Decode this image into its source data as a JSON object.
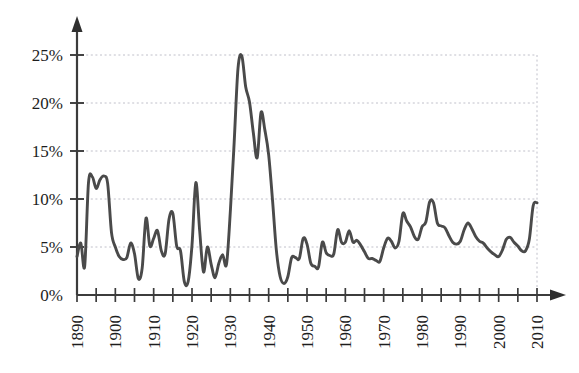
{
  "chart_data": {
    "type": "line",
    "title": "",
    "subtitle": "",
    "xlabel": "",
    "ylabel": "",
    "xlim": [
      1890,
      2010
    ],
    "ylim": [
      0,
      27
    ],
    "grid": true,
    "legend": null,
    "y_ticks": [
      0,
      5,
      10,
      15,
      20,
      25
    ],
    "y_tick_labels": [
      "0%",
      "5%",
      "10%",
      "15%",
      "20%",
      "25%"
    ],
    "x_ticks": [
      1890,
      1900,
      1910,
      1920,
      1930,
      1940,
      1950,
      1960,
      1970,
      1980,
      1990,
      2000,
      2010
    ],
    "x_tick_labels": [
      "1890",
      "1900",
      "1910",
      "1920",
      "1930",
      "1940",
      "1950",
      "1960",
      "1970",
      "1980",
      "1990",
      "2000",
      "2010"
    ],
    "x_minor_tick_interval": 5,
    "x_tick_label_rotation": -90,
    "series": [
      {
        "name": "Unemployment rate",
        "color": "#4a4a4a",
        "x": [
          1890,
          1891,
          1892,
          1893,
          1894,
          1895,
          1896,
          1897,
          1898,
          1899,
          1900,
          1901,
          1902,
          1903,
          1904,
          1905,
          1906,
          1907,
          1908,
          1909,
          1910,
          1911,
          1912,
          1913,
          1914,
          1915,
          1916,
          1917,
          1918,
          1919,
          1920,
          1921,
          1922,
          1923,
          1924,
          1925,
          1926,
          1927,
          1928,
          1929,
          1930,
          1931,
          1932,
          1933,
          1934,
          1935,
          1936,
          1937,
          1938,
          1939,
          1940,
          1941,
          1942,
          1943,
          1944,
          1945,
          1946,
          1947,
          1948,
          1949,
          1950,
          1951,
          1952,
          1953,
          1954,
          1955,
          1956,
          1957,
          1958,
          1959,
          1960,
          1961,
          1962,
          1963,
          1964,
          1965,
          1966,
          1967,
          1968,
          1969,
          1970,
          1971,
          1972,
          1973,
          1974,
          1975,
          1976,
          1977,
          1978,
          1979,
          1980,
          1981,
          1982,
          1983,
          1984,
          1985,
          1986,
          1987,
          1988,
          1989,
          1990,
          1991,
          1992,
          1993,
          1994,
          1995,
          1996,
          1997,
          1998,
          1999,
          2000,
          2001,
          2002,
          2003,
          2004,
          2005,
          2006,
          2007,
          2008,
          2009,
          2010
        ],
        "values": [
          4.0,
          5.4,
          3.0,
          11.7,
          12.3,
          11.1,
          12.0,
          12.4,
          11.6,
          6.5,
          5.0,
          4.0,
          3.7,
          3.9,
          5.4,
          4.3,
          1.7,
          2.8,
          8.0,
          5.1,
          5.9,
          6.7,
          4.6,
          4.3,
          7.9,
          8.5,
          5.1,
          4.6,
          1.4,
          1.4,
          5.2,
          11.7,
          6.7,
          2.4,
          5.0,
          3.2,
          1.8,
          3.3,
          4.2,
          3.2,
          8.7,
          15.9,
          23.6,
          24.9,
          21.7,
          20.1,
          16.9,
          14.3,
          19.0,
          17.2,
          14.6,
          9.9,
          4.7,
          1.9,
          1.2,
          1.9,
          3.9,
          3.9,
          3.8,
          5.9,
          5.3,
          3.3,
          3.0,
          2.9,
          5.5,
          4.4,
          4.1,
          4.3,
          6.8,
          5.5,
          5.5,
          6.7,
          5.5,
          5.7,
          5.2,
          4.5,
          3.8,
          3.8,
          3.6,
          3.5,
          4.9,
          5.9,
          5.6,
          4.9,
          5.6,
          8.5,
          7.7,
          7.1,
          6.1,
          5.8,
          7.1,
          7.6,
          9.7,
          9.6,
          7.5,
          7.2,
          7.0,
          6.2,
          5.5,
          5.3,
          5.6,
          6.8,
          7.5,
          6.9,
          6.1,
          5.6,
          5.4,
          4.9,
          4.5,
          4.2,
          4.0,
          4.7,
          5.8,
          6.0,
          5.5,
          5.1,
          4.6,
          4.6,
          5.8,
          9.3,
          9.6
        ]
      }
    ],
    "notable_points": [
      {
        "year": 1894,
        "value": 12.3,
        "note": "Panic of 1893 peak"
      },
      {
        "year": 1933,
        "value": 21.2,
        "note": "Great Depression peak"
      },
      {
        "year": 1938,
        "value": 17.8,
        "note": "Recession of 1937-38"
      },
      {
        "year": 1944,
        "value": 1.2,
        "note": "Wartime low"
      },
      {
        "year": 1982,
        "value": 9.7,
        "note": "Early 1980s recession"
      },
      {
        "year": 2010,
        "value": 9.4,
        "note": "Great Recession"
      }
    ]
  },
  "axes": {
    "y_axis_name": "y-axis",
    "x_axis_name": "x-axis"
  }
}
